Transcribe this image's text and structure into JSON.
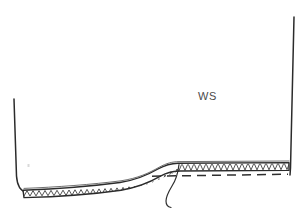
{
  "figure": {
    "type": "technical-cross-section-line-drawing",
    "background_color": "#ffffff",
    "ink_color": "#2b2b2b",
    "width": 308,
    "height": 217,
    "labels": [
      {
        "id": "ws",
        "text": "WS",
        "x": 198,
        "y": 91,
        "color": "#4a4a4a",
        "font_size_px": 11
      }
    ],
    "elements": {
      "left_wall": {
        "name": "left-wall",
        "description": "near-vertical line descending from upper left, curving right at the base into the lined floor",
        "top_x": 14,
        "top_y": 99,
        "bottom_x": 22,
        "bottom_y": 192
      },
      "right_wall": {
        "name": "right-wall",
        "description": "near-vertical line descending from top right down to the raised lined bench",
        "top_x": 294,
        "top_y": 17,
        "bottom_x": 290,
        "bottom_y": 174
      },
      "lined_band": {
        "name": "hatched-lining-band",
        "description": "narrow band following the floor profile, filled with a continuous zigzag/chevron hatch",
        "hatch_pattern": "zigzag",
        "hatch_period_px": 6,
        "band_thickness_px": 7
      },
      "floor_profile": {
        "name": "floor-profile",
        "description": "low flat floor on the left rising through a central ramp to a higher flat bench on the right",
        "left_floor_y": 194,
        "ramp_start_x": 120,
        "ramp_end_x": 175,
        "right_bench_y": 167
      },
      "dashed_line": {
        "name": "dashed-reference-line",
        "description": "long dashed line running beneath the raised bench portion of the band",
        "start_x": 150,
        "end_x": 288,
        "y": 174
      },
      "leader_line": {
        "name": "leader-line",
        "description": "thin J-shaped leader hooking down from the band near the top of the ramp",
        "anchor_x": 178,
        "anchor_y": 167,
        "tip_x": 168,
        "tip_y": 207
      },
      "speck": {
        "name": "paper-speck",
        "description": "faint scanning artifact speck on the blank interior",
        "x": 28,
        "y": 165
      }
    }
  }
}
